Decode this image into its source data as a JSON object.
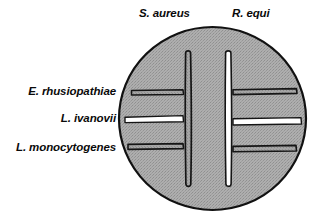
{
  "figure": {
    "title": "",
    "type": "camp-test-agar-plate-diagram",
    "canvas": {
      "width": 319,
      "height": 223,
      "background": "#ffffff"
    },
    "plate": {
      "name": "blood-agar-plate",
      "center_x": 212.5,
      "center_y": 118.5,
      "radius_x": 94.5,
      "radius_y": 92.5,
      "fill_color": "#a8a8a8",
      "outline_color": "#111111",
      "outline_width": 2
    },
    "column_labels": [
      {
        "id": "s-aureus",
        "text": "S. aureus",
        "x": 139,
        "y": 8
      },
      {
        "id": "r-equi",
        "text": "R. equi",
        "x": 232,
        "y": 8
      }
    ],
    "row_labels": [
      {
        "id": "e-rhusiopathiae",
        "text": "E. rhusiopathiae",
        "y": 86
      },
      {
        "id": "l-ivanovii",
        "text": "L. ivanovii",
        "y": 113
      },
      {
        "id": "l-monocytogenes",
        "text": "L. monocytogenes",
        "y": 142
      }
    ],
    "vertical_streaks": [
      {
        "id": "streak-s-aureus",
        "organism": "S. aureus",
        "x": 188,
        "y_top": 52,
        "y_bottom": 186,
        "fill": "#9d9d9d",
        "fill_name": "gray",
        "hemolysis": "none"
      },
      {
        "id": "streak-r-equi",
        "organism": "R. equi",
        "x": 228,
        "y_top": 52,
        "y_bottom": 186,
        "fill": "#ffffff",
        "fill_name": "white",
        "hemolysis": "clear"
      }
    ],
    "horizontal_streaks": [
      {
        "id": "streak-left-e-rhusiopathiae",
        "organism": "E. rhusiopathiae",
        "side": "left",
        "partner": "S. aureus",
        "x_start": 131,
        "x_end": 184,
        "y": 92,
        "fill": "#9d9d9d",
        "fill_name": "gray",
        "camp_result": "negative"
      },
      {
        "id": "streak-left-l-ivanovii",
        "organism": "L. ivanovii",
        "side": "left",
        "partner": "S. aureus",
        "x_start": 125,
        "x_end": 184,
        "y": 119,
        "fill": "#ffffff",
        "fill_name": "white",
        "camp_result": "positive"
      },
      {
        "id": "streak-left-l-monocytogenes",
        "organism": "L. monocytogenes",
        "side": "left",
        "partner": "S. aureus",
        "x_start": 128,
        "x_end": 184,
        "y": 146,
        "fill": "#9d9d9d",
        "fill_name": "gray",
        "camp_result": "negative"
      },
      {
        "id": "streak-right-e-rhusiopathiae",
        "organism": "E. rhusiopathiae",
        "side": "right",
        "partner": "R. equi",
        "x_start": 233,
        "x_end": 297,
        "y": 91,
        "fill": "#9d9d9d",
        "fill_name": "gray",
        "camp_result": "negative"
      },
      {
        "id": "streak-right-l-ivanovii",
        "organism": "L. ivanovii",
        "side": "right",
        "partner": "R. equi",
        "x_start": 233,
        "x_end": 302,
        "y": 121,
        "fill": "#ffffff",
        "fill_name": "white",
        "camp_result": "positive"
      },
      {
        "id": "streak-right-l-monocytogenes",
        "organism": "L. monocytogenes",
        "side": "right",
        "partner": "R. equi",
        "x_start": 233,
        "x_end": 296,
        "y": 148,
        "fill": "#9d9d9d",
        "fill_name": "gray",
        "camp_result": "negative"
      }
    ]
  }
}
